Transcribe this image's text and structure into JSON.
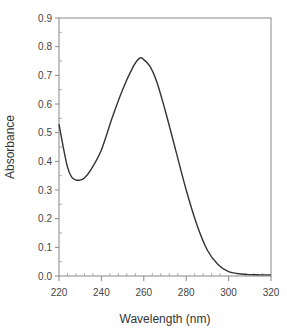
{
  "chart_data": {
    "type": "line",
    "title": "",
    "xlabel": "Wavelength (nm)",
    "ylabel": "Absorbance",
    "xlim": [
      220,
      320
    ],
    "ylim": [
      0.0,
      0.9
    ],
    "x_ticks": [
      "220",
      "240",
      "260",
      "280",
      "300",
      "320"
    ],
    "y_ticks": [
      "0.0",
      "0.1",
      "0.2",
      "0.3",
      "0.4",
      "0.5",
      "0.6",
      "0.7",
      "0.8",
      "0.9"
    ],
    "grid": false,
    "legend": null,
    "series": [
      {
        "name": "Absorbance",
        "color": "#333333",
        "x": [
          220,
          222,
          224,
          226,
          228,
          230,
          232,
          235,
          240,
          245,
          250,
          255,
          258,
          260,
          263,
          266,
          270,
          275,
          280,
          285,
          290,
          295,
          300,
          305,
          310,
          315,
          320
        ],
        "values": [
          0.53,
          0.45,
          0.38,
          0.345,
          0.335,
          0.335,
          0.342,
          0.37,
          0.44,
          0.55,
          0.65,
          0.73,
          0.76,
          0.755,
          0.73,
          0.68,
          0.58,
          0.44,
          0.3,
          0.18,
          0.09,
          0.04,
          0.015,
          0.008,
          0.005,
          0.004,
          0.004
        ]
      }
    ]
  }
}
